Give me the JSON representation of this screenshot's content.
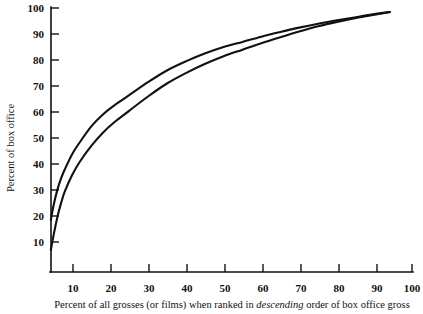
{
  "chart_data": {
    "type": "line",
    "title": "",
    "subtitle": "",
    "xlabel_parts": {
      "before": "Percent of all grosses (or films) when ranked in ",
      "emphasis": "descending",
      "after": " order of box office gross"
    },
    "xlabel": "Percent of all grosses (or films) when ranked in descending order of box office gross",
    "ylabel": "Percent of box office",
    "xlim": [
      0,
      100
    ],
    "ylim": [
      0,
      100
    ],
    "xticks": [
      10,
      20,
      30,
      40,
      50,
      60,
      70,
      80,
      90,
      100
    ],
    "xtick_labels": [
      "10",
      "20",
      "30",
      "40",
      "50",
      "60",
      "70",
      "80",
      "90",
      "100"
    ],
    "yticks": [
      10,
      20,
      30,
      40,
      50,
      60,
      70,
      80,
      90,
      100
    ],
    "ytick_labels": [
      "10",
      "20",
      "30",
      "40",
      "50",
      "60",
      "70",
      "80",
      "90",
      "100"
    ],
    "grid": false,
    "legend": "none",
    "tick_direction": "in",
    "axis_color": "#111111",
    "series": [
      {
        "name": "upper-concentration-curve",
        "color": "#111111",
        "x": [
          4.3,
          5,
          6,
          7,
          8,
          10,
          12,
          15,
          18,
          21,
          25,
          30,
          35,
          40,
          45,
          50,
          55,
          60,
          65,
          70,
          75,
          80,
          85,
          90,
          94
        ],
        "y": [
          20.0,
          25.5,
          31.5,
          36.0,
          39.5,
          45.5,
          50.0,
          56.0,
          60.5,
          64.0,
          68.0,
          73.0,
          77.5,
          81.0,
          84.0,
          86.5,
          88.5,
          90.5,
          92.3,
          94.0,
          95.5,
          96.8,
          98.0,
          99.2,
          100.0
        ]
      },
      {
        "name": "lower-concentration-curve",
        "color": "#111111",
        "x": [
          4.3,
          5,
          6,
          7,
          8,
          10,
          12,
          15,
          18,
          21,
          25,
          30,
          35,
          40,
          45,
          50,
          55,
          60,
          65,
          70,
          75,
          80,
          85,
          90,
          94
        ],
        "y": [
          8.5,
          14.0,
          21.0,
          26.5,
          31.0,
          37.5,
          42.5,
          48.5,
          53.5,
          57.5,
          62.0,
          67.5,
          72.5,
          76.5,
          80.0,
          83.0,
          85.5,
          88.0,
          90.3,
          92.5,
          94.5,
          96.2,
          97.7,
          99.0,
          100.0
        ]
      }
    ]
  }
}
